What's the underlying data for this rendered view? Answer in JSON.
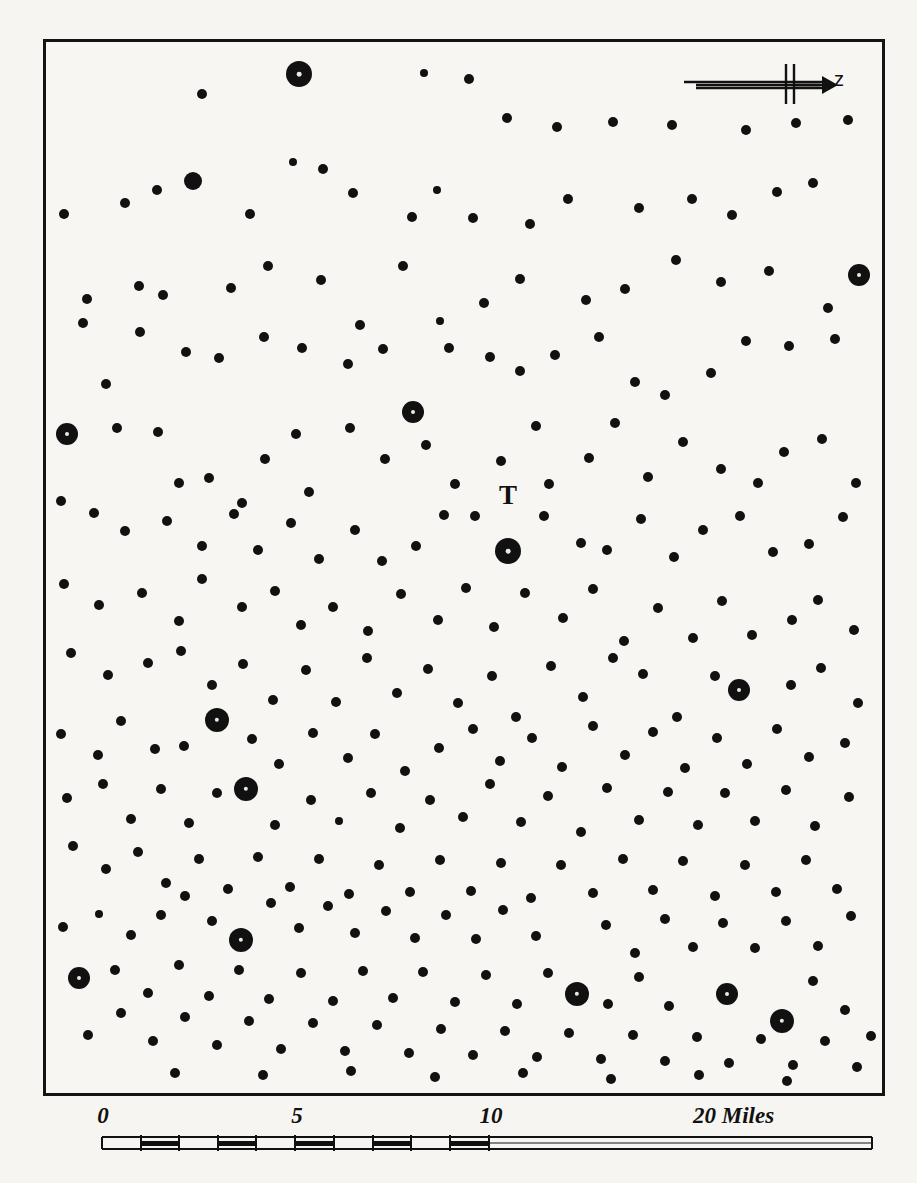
{
  "figure": {
    "kind": "dot-distribution-map",
    "background_color": "#f7f5f2",
    "ink_color": "#111111",
    "frame": {
      "x": 43,
      "y": 39,
      "width": 842,
      "height": 1057,
      "border_px": 3
    }
  },
  "direction_indicator": {
    "name": "north-arrow",
    "label": "z",
    "arrow_direction": "right"
  },
  "place_label": {
    "text": "T",
    "x": 505,
    "y": 522
  },
  "scale_bar": {
    "unit_text": "20 Miles",
    "labels": [
      {
        "text": "0",
        "x": 60,
        "end": false
      },
      {
        "text": "5",
        "x": 254,
        "end": false
      },
      {
        "text": "10",
        "x": 448,
        "end": false
      },
      {
        "text": "20 Miles",
        "x": 650,
        "end": true
      }
    ],
    "ruler": {
      "total_miles": 20,
      "minor_tick_miles": 1,
      "minor_section_miles": 10,
      "label_ticks": [
        0,
        5,
        10,
        20
      ]
    }
  },
  "chart_data": {
    "type": "scatter",
    "title": "",
    "xlabel": "",
    "ylabel": "",
    "legend": [
      {
        "label": "small settlement",
        "marker_radius_px": 5
      },
      {
        "label": "medium settlement",
        "marker_radius_px": 7
      },
      {
        "label": "large settlement",
        "marker_radius_px": 13
      }
    ],
    "annotations": [
      {
        "text": "T",
        "x": 505,
        "y": 522
      },
      {
        "text": "z",
        "x": 800,
        "y": 62
      },
      {
        "text": "20 Miles",
        "x": 693,
        "y": 1118
      }
    ],
    "points": [
      [
        199,
        91,
        5
      ],
      [
        296,
        71,
        13
      ],
      [
        421,
        70,
        4
      ],
      [
        466,
        76,
        5
      ],
      [
        504,
        115,
        5
      ],
      [
        554,
        124,
        5
      ],
      [
        610,
        119,
        5
      ],
      [
        669,
        122,
        5
      ],
      [
        743,
        127,
        5
      ],
      [
        793,
        120,
        5
      ],
      [
        845,
        117,
        5
      ],
      [
        122,
        200,
        5
      ],
      [
        154,
        187,
        5
      ],
      [
        190,
        178,
        9
      ],
      [
        247,
        211,
        5
      ],
      [
        290,
        159,
        4
      ],
      [
        320,
        166,
        5
      ],
      [
        350,
        190,
        5
      ],
      [
        409,
        214,
        5
      ],
      [
        434,
        187,
        4
      ],
      [
        470,
        215,
        5
      ],
      [
        527,
        221,
        5
      ],
      [
        565,
        196,
        5
      ],
      [
        636,
        205,
        5
      ],
      [
        689,
        196,
        5
      ],
      [
        729,
        212,
        5
      ],
      [
        774,
        189,
        5
      ],
      [
        810,
        180,
        5
      ],
      [
        856,
        272,
        11
      ],
      [
        61,
        211,
        5
      ],
      [
        84,
        296,
        5
      ],
      [
        136,
        283,
        5
      ],
      [
        160,
        292,
        5
      ],
      [
        228,
        285,
        5
      ],
      [
        265,
        263,
        5
      ],
      [
        318,
        277,
        5
      ],
      [
        357,
        322,
        5
      ],
      [
        400,
        263,
        5
      ],
      [
        437,
        318,
        4
      ],
      [
        481,
        300,
        5
      ],
      [
        517,
        276,
        5
      ],
      [
        583,
        297,
        5
      ],
      [
        622,
        286,
        5
      ],
      [
        673,
        257,
        5
      ],
      [
        718,
        279,
        5
      ],
      [
        766,
        268,
        5
      ],
      [
        825,
        305,
        5
      ],
      [
        80,
        320,
        5
      ],
      [
        103,
        381,
        5
      ],
      [
        137,
        329,
        5
      ],
      [
        183,
        349,
        5
      ],
      [
        216,
        355,
        5
      ],
      [
        261,
        334,
        5
      ],
      [
        299,
        345,
        5
      ],
      [
        345,
        361,
        5
      ],
      [
        380,
        346,
        5
      ],
      [
        410,
        409,
        11
      ],
      [
        446,
        345,
        5
      ],
      [
        487,
        354,
        5
      ],
      [
        517,
        368,
        5
      ],
      [
        552,
        352,
        5
      ],
      [
        596,
        334,
        5
      ],
      [
        632,
        379,
        5
      ],
      [
        662,
        392,
        5
      ],
      [
        708,
        370,
        5
      ],
      [
        743,
        338,
        5
      ],
      [
        786,
        343,
        5
      ],
      [
        832,
        336,
        5
      ],
      [
        64,
        431,
        11
      ],
      [
        114,
        425,
        5
      ],
      [
        155,
        429,
        5
      ],
      [
        176,
        480,
        5
      ],
      [
        206,
        475,
        5
      ],
      [
        239,
        500,
        5
      ],
      [
        262,
        456,
        5
      ],
      [
        293,
        431,
        5
      ],
      [
        306,
        489,
        5
      ],
      [
        347,
        425,
        5
      ],
      [
        382,
        456,
        5
      ],
      [
        423,
        442,
        5
      ],
      [
        452,
        481,
        5
      ],
      [
        498,
        458,
        5
      ],
      [
        533,
        423,
        5
      ],
      [
        546,
        481,
        5
      ],
      [
        586,
        455,
        5
      ],
      [
        612,
        420,
        5
      ],
      [
        645,
        474,
        5
      ],
      [
        680,
        439,
        5
      ],
      [
        718,
        466,
        5
      ],
      [
        755,
        480,
        5
      ],
      [
        781,
        449,
        5
      ],
      [
        819,
        436,
        5
      ],
      [
        853,
        480,
        5
      ],
      [
        58,
        498,
        5
      ],
      [
        91,
        510,
        5
      ],
      [
        122,
        528,
        5
      ],
      [
        164,
        518,
        5
      ],
      [
        199,
        543,
        5
      ],
      [
        231,
        511,
        5
      ],
      [
        255,
        547,
        5
      ],
      [
        288,
        520,
        5
      ],
      [
        316,
        556,
        5
      ],
      [
        352,
        527,
        5
      ],
      [
        379,
        558,
        5
      ],
      [
        413,
        543,
        5
      ],
      [
        441,
        512,
        5
      ],
      [
        472,
        513,
        5
      ],
      [
        505,
        548,
        13
      ],
      [
        541,
        513,
        5
      ],
      [
        578,
        540,
        5
      ],
      [
        604,
        547,
        5
      ],
      [
        638,
        516,
        5
      ],
      [
        671,
        554,
        5
      ],
      [
        700,
        527,
        5
      ],
      [
        737,
        513,
        5
      ],
      [
        770,
        549,
        5
      ],
      [
        806,
        541,
        5
      ],
      [
        840,
        514,
        5
      ],
      [
        61,
        581,
        5
      ],
      [
        96,
        602,
        5
      ],
      [
        139,
        590,
        5
      ],
      [
        176,
        618,
        5
      ],
      [
        199,
        576,
        5
      ],
      [
        239,
        604,
        5
      ],
      [
        272,
        588,
        5
      ],
      [
        298,
        622,
        5
      ],
      [
        330,
        604,
        5
      ],
      [
        365,
        628,
        5
      ],
      [
        398,
        591,
        5
      ],
      [
        435,
        617,
        5
      ],
      [
        463,
        585,
        5
      ],
      [
        491,
        624,
        5
      ],
      [
        522,
        590,
        5
      ],
      [
        560,
        615,
        5
      ],
      [
        590,
        586,
        5
      ],
      [
        621,
        638,
        5
      ],
      [
        655,
        605,
        5
      ],
      [
        690,
        635,
        5
      ],
      [
        719,
        598,
        5
      ],
      [
        749,
        632,
        5
      ],
      [
        789,
        617,
        5
      ],
      [
        815,
        597,
        5
      ],
      [
        851,
        627,
        5
      ],
      [
        68,
        650,
        5
      ],
      [
        105,
        672,
        5
      ],
      [
        145,
        660,
        5
      ],
      [
        178,
        648,
        5
      ],
      [
        209,
        682,
        5
      ],
      [
        240,
        661,
        5
      ],
      [
        270,
        697,
        5
      ],
      [
        303,
        667,
        5
      ],
      [
        333,
        699,
        5
      ],
      [
        364,
        655,
        5
      ],
      [
        394,
        690,
        5
      ],
      [
        425,
        666,
        5
      ],
      [
        455,
        700,
        5
      ],
      [
        489,
        673,
        5
      ],
      [
        513,
        714,
        5
      ],
      [
        548,
        663,
        5
      ],
      [
        580,
        694,
        5
      ],
      [
        610,
        655,
        5
      ],
      [
        640,
        671,
        5
      ],
      [
        674,
        714,
        5
      ],
      [
        712,
        673,
        5
      ],
      [
        736,
        687,
        11
      ],
      [
        788,
        682,
        5
      ],
      [
        818,
        665,
        5
      ],
      [
        855,
        700,
        5
      ],
      [
        58,
        731,
        5
      ],
      [
        95,
        752,
        5
      ],
      [
        118,
        718,
        5
      ],
      [
        152,
        746,
        5
      ],
      [
        181,
        743,
        5
      ],
      [
        214,
        717,
        12
      ],
      [
        249,
        736,
        5
      ],
      [
        276,
        761,
        5
      ],
      [
        310,
        730,
        5
      ],
      [
        345,
        755,
        5
      ],
      [
        372,
        731,
        5
      ],
      [
        402,
        768,
        5
      ],
      [
        436,
        745,
        5
      ],
      [
        470,
        726,
        5
      ],
      [
        497,
        758,
        5
      ],
      [
        529,
        735,
        5
      ],
      [
        559,
        764,
        5
      ],
      [
        590,
        723,
        5
      ],
      [
        622,
        752,
        5
      ],
      [
        650,
        729,
        5
      ],
      [
        682,
        765,
        5
      ],
      [
        714,
        735,
        5
      ],
      [
        744,
        761,
        5
      ],
      [
        774,
        726,
        5
      ],
      [
        806,
        754,
        5
      ],
      [
        842,
        740,
        5
      ],
      [
        64,
        795,
        5
      ],
      [
        100,
        781,
        5
      ],
      [
        128,
        816,
        5
      ],
      [
        158,
        786,
        5
      ],
      [
        186,
        820,
        5
      ],
      [
        214,
        790,
        5
      ],
      [
        243,
        786,
        12
      ],
      [
        272,
        822,
        5
      ],
      [
        308,
        797,
        5
      ],
      [
        336,
        818,
        4
      ],
      [
        368,
        790,
        5
      ],
      [
        397,
        825,
        5
      ],
      [
        427,
        797,
        5
      ],
      [
        460,
        814,
        5
      ],
      [
        487,
        781,
        5
      ],
      [
        518,
        819,
        5
      ],
      [
        545,
        793,
        5
      ],
      [
        578,
        829,
        5
      ],
      [
        604,
        785,
        5
      ],
      [
        636,
        817,
        5
      ],
      [
        665,
        789,
        5
      ],
      [
        695,
        822,
        5
      ],
      [
        722,
        790,
        5
      ],
      [
        752,
        818,
        5
      ],
      [
        783,
        787,
        5
      ],
      [
        812,
        823,
        5
      ],
      [
        846,
        794,
        5
      ],
      [
        70,
        843,
        5
      ],
      [
        103,
        866,
        5
      ],
      [
        135,
        849,
        5
      ],
      [
        163,
        880,
        5
      ],
      [
        196,
        856,
        5
      ],
      [
        225,
        886,
        5
      ],
      [
        255,
        854,
        5
      ],
      [
        287,
        884,
        5
      ],
      [
        316,
        856,
        5
      ],
      [
        346,
        891,
        5
      ],
      [
        376,
        862,
        5
      ],
      [
        407,
        889,
        5
      ],
      [
        437,
        857,
        5
      ],
      [
        468,
        888,
        5
      ],
      [
        498,
        860,
        5
      ],
      [
        528,
        895,
        5
      ],
      [
        558,
        862,
        5
      ],
      [
        590,
        890,
        5
      ],
      [
        620,
        856,
        5
      ],
      [
        650,
        887,
        5
      ],
      [
        680,
        858,
        5
      ],
      [
        712,
        893,
        5
      ],
      [
        742,
        862,
        5
      ],
      [
        773,
        889,
        5
      ],
      [
        803,
        857,
        5
      ],
      [
        834,
        886,
        5
      ],
      [
        60,
        924,
        5
      ],
      [
        96,
        911,
        4
      ],
      [
        128,
        932,
        5
      ],
      [
        158,
        912,
        5
      ],
      [
        182,
        893,
        5
      ],
      [
        209,
        918,
        5
      ],
      [
        238,
        937,
        12
      ],
      [
        268,
        900,
        5
      ],
      [
        296,
        925,
        5
      ],
      [
        325,
        903,
        5
      ],
      [
        352,
        930,
        5
      ],
      [
        383,
        908,
        5
      ],
      [
        412,
        935,
        5
      ],
      [
        443,
        912,
        5
      ],
      [
        473,
        936,
        5
      ],
      [
        500,
        907,
        5
      ],
      [
        533,
        933,
        5
      ],
      [
        574,
        991,
        12
      ],
      [
        603,
        922,
        5
      ],
      [
        632,
        950,
        5
      ],
      [
        662,
        916,
        5
      ],
      [
        690,
        944,
        5
      ],
      [
        720,
        920,
        5
      ],
      [
        752,
        945,
        5
      ],
      [
        783,
        918,
        5
      ],
      [
        815,
        943,
        5
      ],
      [
        848,
        913,
        5
      ],
      [
        76,
        975,
        11
      ],
      [
        112,
        967,
        5
      ],
      [
        145,
        990,
        5
      ],
      [
        176,
        962,
        5
      ],
      [
        206,
        993,
        5
      ],
      [
        236,
        967,
        5
      ],
      [
        266,
        996,
        5
      ],
      [
        298,
        970,
        5
      ],
      [
        330,
        998,
        5
      ],
      [
        360,
        968,
        5
      ],
      [
        390,
        995,
        5
      ],
      [
        420,
        969,
        5
      ],
      [
        452,
        999,
        5
      ],
      [
        483,
        972,
        5
      ],
      [
        514,
        1001,
        5
      ],
      [
        545,
        970,
        5
      ],
      [
        605,
        1001,
        5
      ],
      [
        636,
        974,
        5
      ],
      [
        666,
        1003,
        5
      ],
      [
        724,
        991,
        11
      ],
      [
        779,
        1018,
        12
      ],
      [
        810,
        978,
        5
      ],
      [
        842,
        1007,
        5
      ],
      [
        868,
        1033,
        5
      ],
      [
        85,
        1032,
        5
      ],
      [
        118,
        1010,
        5
      ],
      [
        150,
        1038,
        5
      ],
      [
        182,
        1014,
        5
      ],
      [
        214,
        1042,
        5
      ],
      [
        246,
        1018,
        5
      ],
      [
        278,
        1046,
        5
      ],
      [
        310,
        1020,
        5
      ],
      [
        342,
        1048,
        5
      ],
      [
        374,
        1022,
        5
      ],
      [
        406,
        1050,
        5
      ],
      [
        438,
        1026,
        5
      ],
      [
        470,
        1052,
        5
      ],
      [
        502,
        1028,
        5
      ],
      [
        534,
        1054,
        5
      ],
      [
        566,
        1030,
        5
      ],
      [
        598,
        1056,
        5
      ],
      [
        630,
        1032,
        5
      ],
      [
        662,
        1058,
        5
      ],
      [
        694,
        1034,
        5
      ],
      [
        726,
        1060,
        5
      ],
      [
        758,
        1036,
        5
      ],
      [
        790,
        1062,
        5
      ],
      [
        822,
        1038,
        5
      ],
      [
        854,
        1064,
        5
      ],
      [
        172,
        1070,
        5
      ],
      [
        260,
        1072,
        5
      ],
      [
        348,
        1068,
        5
      ],
      [
        432,
        1074,
        5
      ],
      [
        520,
        1070,
        5
      ],
      [
        608,
        1076,
        5
      ],
      [
        696,
        1072,
        5
      ],
      [
        784,
        1078,
        5
      ]
    ]
  }
}
